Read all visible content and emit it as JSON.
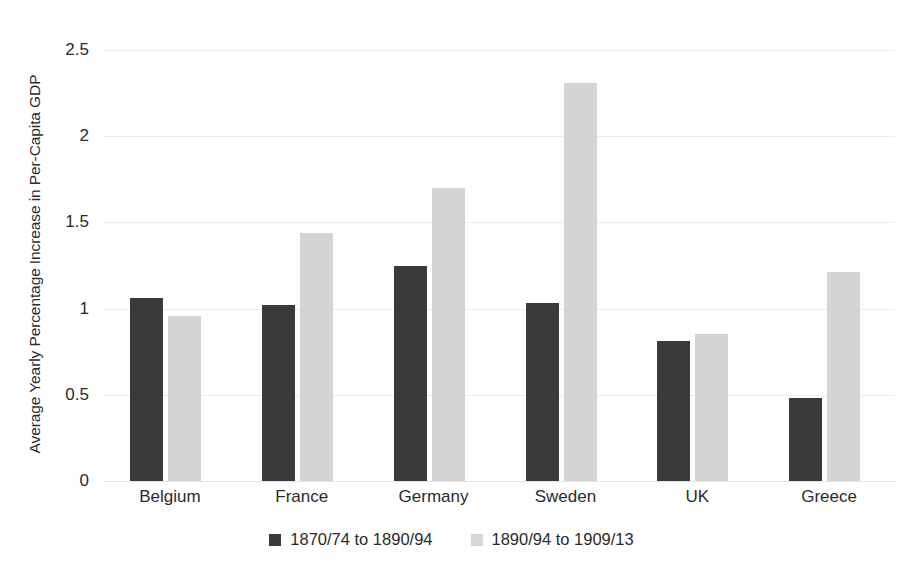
{
  "chart_data": {
    "type": "bar",
    "title": "",
    "subtitle": "",
    "xlabel": "",
    "ylabel": "Average Yearly Percentage Increase in Per-Capita GDP",
    "categories": [
      "Belgium",
      "France",
      "Germany",
      "Sweden",
      "UK",
      "Greece"
    ],
    "series": [
      {
        "name": "1870/74 to 1890/94",
        "color": "#3a3a3a",
        "values": [
          1.06,
          1.02,
          1.25,
          1.03,
          0.81,
          0.48
        ]
      },
      {
        "name": "1890/94 to 1909/13",
        "color": "#d4d4d4",
        "values": [
          0.96,
          1.44,
          1.7,
          2.31,
          0.85,
          1.21
        ]
      }
    ],
    "ylim": [
      0,
      2.5
    ],
    "yticks": [
      0,
      0.5,
      1,
      1.5,
      2,
      2.5
    ],
    "ytick_labels": [
      "0",
      "0.5",
      "1",
      "1.5",
      "2",
      "2.5"
    ],
    "grid": true,
    "grid_axis": "y",
    "legend_position": "bottom",
    "background_color": "#ffffff",
    "gridline_color": "#ececed"
  }
}
